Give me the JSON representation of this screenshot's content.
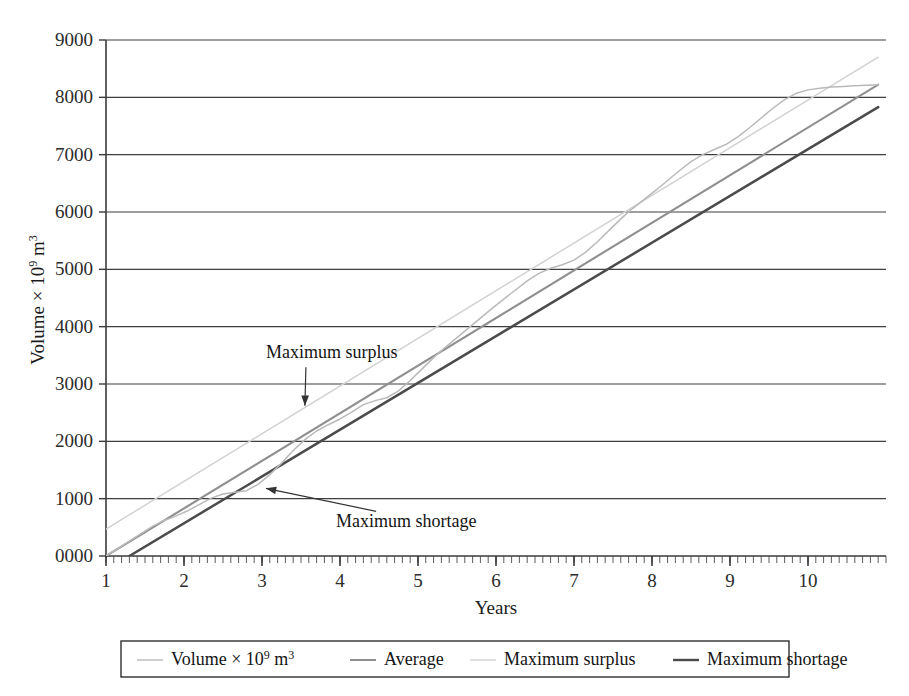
{
  "figure": {
    "background": "#ffffff",
    "plot_border_color": "#3a3a3a"
  },
  "axes": {
    "y_title_main": "Volume",
    "y_title_times": "× 10",
    "y_title_exp1": "9",
    "y_title_unit": " m",
    "y_title_exp2": "3",
    "y_title_full": "Volume × 10⁹ m³",
    "x_title": "Years",
    "y_ticks": [
      "0000",
      "1000",
      "2000",
      "3000",
      "4000",
      "5000",
      "6000",
      "7000",
      "8000",
      "9000"
    ],
    "x_ticks": [
      "1",
      "2",
      "3",
      "4",
      "5",
      "6",
      "7",
      "8",
      "9",
      "10"
    ]
  },
  "annotations": [
    {
      "id": "max-surplus",
      "text": "Maximum surplus"
    },
    {
      "id": "max-shortage",
      "text": "Maximum shortage"
    }
  ],
  "legend": {
    "items": [
      {
        "label": "Volume × 10⁹ m³",
        "label_main": "Volume",
        "label_times": "× 10",
        "label_exp1": "9",
        "label_unit": " m",
        "label_exp2": "3",
        "color": "#b9b9b9",
        "width": 1.4
      },
      {
        "label": "Average",
        "color": "#8f8f8f",
        "width": 2.0
      },
      {
        "label": "Maximum surplus",
        "color": "#d2d2d2",
        "width": 1.4
      },
      {
        "label": "Maximum shortage",
        "color": "#4b4b4b",
        "width": 2.4
      }
    ]
  },
  "chart_data": {
    "type": "line",
    "title": "",
    "xlabel": "Years",
    "ylabel": "Volume × 10⁹ m³",
    "xlim": [
      1,
      11
    ],
    "ylim": [
      0,
      9000
    ],
    "grid": true,
    "grid_axis": "y",
    "legend_position": "bottom-outside",
    "x_major_ticks": [
      1,
      2,
      3,
      4,
      5,
      6,
      7,
      8,
      9,
      10
    ],
    "y_major_ticks": [
      0,
      1000,
      2000,
      3000,
      4000,
      5000,
      6000,
      7000,
      8000,
      9000
    ],
    "x_minor_tick_interval": 0.1,
    "series": [
      {
        "name": "Volume × 10⁹ m³",
        "color": "#b9b9b9",
        "type": "line",
        "x": [
          1.0,
          1.15,
          1.3,
          1.45,
          1.6,
          1.75,
          1.9,
          2.05,
          2.2,
          2.35,
          2.5,
          2.65,
          2.8,
          2.95,
          3.1,
          3.25,
          3.4,
          3.55,
          3.7,
          3.85,
          4.0,
          4.15,
          4.3,
          4.45,
          4.6,
          4.75,
          4.9,
          5.05,
          5.2,
          5.35,
          5.5,
          5.65,
          5.8,
          5.95,
          6.1,
          6.25,
          6.4,
          6.55,
          6.7,
          6.85,
          7.0,
          7.15,
          7.3,
          7.45,
          7.6,
          7.75,
          7.9,
          8.05,
          8.2,
          8.35,
          8.5,
          8.65,
          8.8,
          8.95,
          9.1,
          9.25,
          9.4,
          9.55,
          9.7,
          9.85,
          10.0,
          10.15,
          10.3,
          10.45,
          10.6,
          10.75,
          10.9
        ],
        "y": [
          0,
          130,
          260,
          390,
          520,
          620,
          700,
          790,
          900,
          1010,
          1080,
          1110,
          1140,
          1250,
          1420,
          1620,
          1840,
          2030,
          2180,
          2290,
          2390,
          2510,
          2640,
          2710,
          2760,
          2880,
          3060,
          3260,
          3460,
          3640,
          3810,
          3980,
          4150,
          4320,
          4480,
          4640,
          4800,
          4930,
          5020,
          5080,
          5160,
          5300,
          5480,
          5680,
          5880,
          6060,
          6220,
          6380,
          6550,
          6720,
          6880,
          7000,
          7090,
          7180,
          7310,
          7470,
          7640,
          7810,
          7960,
          8070,
          8130,
          8160,
          8180,
          8190,
          8200,
          8210,
          8220
        ]
      },
      {
        "name": "Average",
        "color": "#8f8f8f",
        "type": "line",
        "x": [
          1.0,
          10.9
        ],
        "y": [
          0,
          8220
        ],
        "note": "straight best-fit line through origin of the cumulative volume curve"
      },
      {
        "name": "Maximum surplus",
        "color": "#d2d2d2",
        "type": "line",
        "x": [
          1.0,
          10.9
        ],
        "y": [
          470,
          8700
        ],
        "note": "line parallel to Average, tangent above the cumulative curve"
      },
      {
        "name": "Maximum shortage",
        "color": "#4b4b4b",
        "type": "line",
        "x": [
          1.3,
          10.9
        ],
        "y": [
          0,
          7830
        ],
        "note": "line parallel to Average, tangent below the cumulative curve"
      }
    ],
    "annotations": [
      {
        "text": "Maximum surplus",
        "text_x": 3.05,
        "text_y": 3450,
        "arrow_to_x": 3.55,
        "arrow_to_y": 2620
      },
      {
        "text": "Maximum shortage",
        "text_x": 3.95,
        "text_y": 500,
        "arrow_to_x": 3.05,
        "arrow_to_y": 1180
      }
    ]
  }
}
